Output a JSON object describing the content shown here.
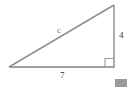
{
  "figure": {
    "shape": "right triangle",
    "background_color": "#ffffff",
    "stroke_color": "#808080",
    "right_angle_marker": "square",
    "labels": {
      "hypotenuse": "c",
      "vertical_leg": "4",
      "horizontal_leg": "7"
    },
    "label_colors": {
      "hypotenuse": "#6f6f6f",
      "vertical_leg": "#3a3a3a",
      "horizontal_leg": "#3a3a3a"
    },
    "geometry": {
      "left_vertex": [
        9,
        67
      ],
      "right_angle_vertex": [
        114,
        67
      ],
      "top_vertex": [
        114,
        5
      ],
      "right_angle_box": [
        105,
        58,
        9,
        9
      ]
    },
    "artifact": {
      "name": "corner-swatch",
      "color": "#9a9a9a",
      "rect": [
        115,
        79,
        12,
        8
      ]
    }
  }
}
